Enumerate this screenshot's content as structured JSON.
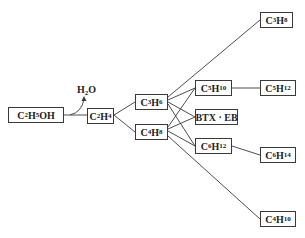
{
  "diagram": {
    "type": "reaction-network",
    "nodes": [
      {
        "id": "C2H5OH",
        "parts": [
          [
            "C",
            "2"
          ],
          [
            "H",
            "5"
          ],
          [
            "OH",
            ""
          ]
        ],
        "x": 8,
        "y": 107,
        "w": 56,
        "h": 16
      },
      {
        "id": "C2H4",
        "parts": [
          [
            "C",
            "2"
          ],
          [
            "H",
            "4"
          ]
        ],
        "x": 87,
        "y": 108,
        "w": 27,
        "h": 16
      },
      {
        "id": "C3H6",
        "parts": [
          [
            "C",
            "3"
          ],
          [
            "H",
            "6"
          ]
        ],
        "x": 135,
        "y": 94,
        "w": 33,
        "h": 16
      },
      {
        "id": "C4H8",
        "parts": [
          [
            "C",
            "4"
          ],
          [
            "H",
            "8"
          ]
        ],
        "x": 135,
        "y": 124,
        "w": 33,
        "h": 16
      },
      {
        "id": "C5H10",
        "parts": [
          [
            "C",
            "5"
          ],
          [
            "H",
            "10"
          ]
        ],
        "x": 195,
        "y": 80,
        "w": 37,
        "h": 16
      },
      {
        "id": "BTX·EB",
        "parts": [
          [
            "BTX · EB",
            ""
          ]
        ],
        "x": 195,
        "y": 109,
        "w": 43,
        "h": 16
      },
      {
        "id": "C6H12",
        "parts": [
          [
            "C",
            "6"
          ],
          [
            "H",
            "12"
          ]
        ],
        "x": 195,
        "y": 138,
        "w": 37,
        "h": 16
      },
      {
        "id": "C3H8",
        "parts": [
          [
            "C",
            "3"
          ],
          [
            "H",
            "8"
          ]
        ],
        "x": 260,
        "y": 12,
        "w": 33,
        "h": 16
      },
      {
        "id": "C5H12",
        "parts": [
          [
            "C",
            "5"
          ],
          [
            "H",
            "12"
          ]
        ],
        "x": 260,
        "y": 80,
        "w": 36,
        "h": 16
      },
      {
        "id": "C6H14",
        "parts": [
          [
            "C",
            "6"
          ],
          [
            "H",
            "14"
          ]
        ],
        "x": 260,
        "y": 147,
        "w": 36,
        "h": 16
      },
      {
        "id": "C4H10",
        "parts": [
          [
            "C",
            "4"
          ],
          [
            "H",
            "10"
          ]
        ],
        "x": 260,
        "y": 211,
        "w": 36,
        "h": 16
      }
    ],
    "byproduct": {
      "id": "H2O",
      "parts": [
        [
          "H",
          "2"
        ],
        [
          "O",
          ""
        ]
      ],
      "x": 77,
      "y": 84
    },
    "edges": [
      {
        "from": "C2H5OH",
        "to": "C2H4"
      },
      {
        "from": "C2H4",
        "to": "C3H6"
      },
      {
        "from": "C2H4",
        "to": "C4H8"
      },
      {
        "from": "C3H6",
        "to": "C3H8"
      },
      {
        "from": "C3H6",
        "to": "C5H10"
      },
      {
        "from": "C3H6",
        "to": "BTX·EB"
      },
      {
        "from": "C3H6",
        "to": "C6H12"
      },
      {
        "from": "C4H8",
        "to": "C5H10"
      },
      {
        "from": "C4H8",
        "to": "BTX·EB"
      },
      {
        "from": "C4H8",
        "to": "C6H12"
      },
      {
        "from": "C4H8",
        "to": "C4H10"
      },
      {
        "from": "C5H10",
        "to": "C5H12"
      },
      {
        "from": "C6H12",
        "to": "C6H14"
      }
    ],
    "colors": {
      "line": "#3a3a3a",
      "text": "#222222",
      "background": "#ffffff"
    }
  }
}
